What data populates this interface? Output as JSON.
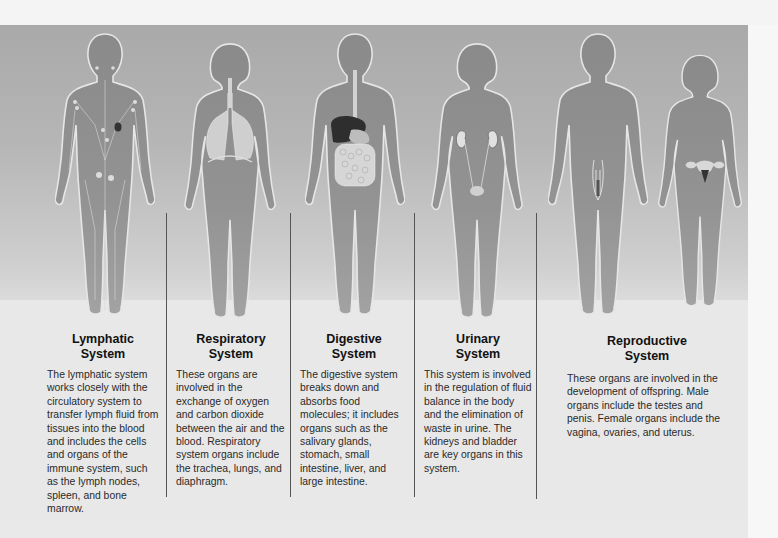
{
  "systems": [
    {
      "title_line1": "Lymphatic",
      "title_line2": "System",
      "description": "The lymphatic system works closely with the circulatory system to transfer lymph fluid from tissues into the blood and includes the cells and organs of the immune system, such as the lymph nodes, spleen, and bone marrow.",
      "figure": "male-body-lymphatic"
    },
    {
      "title_line1": "Respiratory",
      "title_line2": "System",
      "description": "These organs are involved in the exchange of oxygen and carbon dioxide between the air and the blood. Respiratory system organs include the trachea, lungs, and diaphragm.",
      "figure": "female-body-respiratory"
    },
    {
      "title_line1": "Digestive",
      "title_line2": "System",
      "description": "The digestive system breaks down and absorbs food molecules; it includes organs such as the salivary glands, stomach, small intestine, liver, and large intestine.",
      "figure": "male-body-digestive"
    },
    {
      "title_line1": "Urinary",
      "title_line2": "System",
      "description": "This system is involved in the regulation of fluid balance in the body and the elimination of waste in urine. The kidneys and bladder are key organs in this system.",
      "figure": "female-body-urinary"
    },
    {
      "title_line1": "Reproductive",
      "title_line2": "System",
      "description": "These organs are involved in the development of offspring. Male organs include the testes and penis. Female organs include the vagina, ovaries, and uterus.",
      "figure": "male-and-female-body-reproductive"
    }
  ],
  "colors": {
    "panel_top": "#a9a9a9",
    "panel_bottom": "#e8e8e8",
    "body_fill": "#8c8c8c",
    "body_outline": "#e6e6e6",
    "divider": "#555555",
    "text": "#2a2a2a"
  }
}
